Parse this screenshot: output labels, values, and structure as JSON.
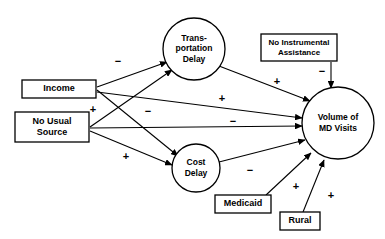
{
  "diagram": {
    "type": "path-diagram",
    "canvas": {
      "width": 385,
      "height": 239
    },
    "colors": {
      "background": "#ffffff",
      "stroke": "#000000",
      "text": "#000000"
    },
    "nodes": [
      {
        "id": "transportation-delay",
        "shape": "circle",
        "label_lines": [
          "Trans-",
          "portation",
          "Delay"
        ],
        "cx": 194,
        "cy": 49,
        "r": 31,
        "font_size": 8.5
      },
      {
        "id": "income",
        "shape": "box",
        "label_lines": [
          "Income"
        ],
        "x": 22,
        "y": 80,
        "w": 74,
        "h": 18,
        "font_size": 9
      },
      {
        "id": "no-usual-source",
        "shape": "box",
        "label_lines": [
          "No Usual",
          "Source"
        ],
        "x": 15,
        "y": 112,
        "w": 74,
        "h": 30,
        "font_size": 9
      },
      {
        "id": "no-instrumental-assistance",
        "shape": "box",
        "label_lines": [
          "No Instrumental",
          "Assistance"
        ],
        "x": 261,
        "y": 34,
        "w": 76,
        "h": 27,
        "font_size": 8
      },
      {
        "id": "volume-of-md-visits",
        "shape": "circle",
        "label_lines": [
          "Volume of",
          "MD Visits"
        ],
        "cx": 338,
        "cy": 123,
        "r": 36,
        "font_size": 8.5
      },
      {
        "id": "cost-delay",
        "shape": "circle",
        "label_lines": [
          "Cost",
          "Delay"
        ],
        "cx": 196,
        "cy": 168,
        "r": 24,
        "font_size": 8.5
      },
      {
        "id": "medicaid",
        "shape": "box",
        "label_lines": [
          "Medicaid"
        ],
        "x": 215,
        "y": 195,
        "w": 56,
        "h": 18,
        "font_size": 9
      },
      {
        "id": "rural",
        "shape": "box",
        "label_lines": [
          "Rural"
        ],
        "x": 280,
        "y": 212,
        "w": 40,
        "h": 18,
        "font_size": 9
      }
    ],
    "edges": [
      {
        "id": "income-to-transportation-delay",
        "from": "income",
        "to": "transportation-delay",
        "sign": "−",
        "x1": 97,
        "y1": 87,
        "x2": 167,
        "y2": 62,
        "sign_x": 118,
        "sign_y": 62
      },
      {
        "id": "income-to-cost-delay",
        "from": "income",
        "to": "cost-delay",
        "sign": "−",
        "x1": 97,
        "y1": 90,
        "x2": 178,
        "y2": 156,
        "sign_x": 148,
        "sign_y": 112
      },
      {
        "id": "income-to-volume",
        "from": "income",
        "to": "volume-of-md-visits",
        "sign": "+",
        "x1": 97,
        "y1": 92,
        "x2": 302,
        "y2": 118,
        "sign_x": 222,
        "sign_y": 99
      },
      {
        "id": "no-usual-source-to-transportation-delay",
        "from": "no-usual-source",
        "to": "transportation-delay",
        "sign": "+",
        "x1": 90,
        "y1": 127,
        "x2": 172,
        "y2": 70,
        "sign_x": 93,
        "sign_y": 110
      },
      {
        "id": "no-usual-source-to-volume",
        "from": "no-usual-source",
        "to": "volume-of-md-visits",
        "sign": "−",
        "x1": 90,
        "y1": 128,
        "x2": 302,
        "y2": 126,
        "sign_x": 233,
        "sign_y": 122
      },
      {
        "id": "no-usual-source-to-cost-delay",
        "from": "no-usual-source",
        "to": "cost-delay",
        "sign": "+",
        "x1": 90,
        "y1": 131,
        "x2": 172,
        "y2": 165,
        "sign_x": 126,
        "sign_y": 157
      },
      {
        "id": "transportation-delay-to-volume",
        "from": "transportation-delay",
        "to": "volume-of-md-visits",
        "sign": "+",
        "x1": 219,
        "y1": 66,
        "x2": 310,
        "y2": 101,
        "sign_x": 277,
        "sign_y": 82
      },
      {
        "id": "no-instrumental-assistance-to-volume",
        "from": "no-instrumental-assistance",
        "to": "volume-of-md-visits",
        "sign": "−",
        "x1": 331,
        "y1": 62,
        "x2": 331,
        "y2": 88,
        "sign_x": 322,
        "sign_y": 72
      },
      {
        "id": "cost-delay-to-volume",
        "from": "cost-delay",
        "to": "volume-of-md-visits",
        "sign": "−",
        "x1": 219,
        "y1": 162,
        "x2": 305,
        "y2": 140,
        "sign_x": 250,
        "sign_y": 171
      },
      {
        "id": "medicaid-to-volume",
        "from": "medicaid",
        "to": "volume-of-md-visits",
        "sign": "+",
        "x1": 266,
        "y1": 195,
        "x2": 311,
        "y2": 153,
        "sign_x": 296,
        "sign_y": 187
      },
      {
        "id": "rural-to-volume",
        "from": "rural",
        "to": "volume-of-md-visits",
        "sign": "+",
        "x1": 303,
        "y1": 212,
        "x2": 324,
        "y2": 160,
        "sign_x": 331,
        "sign_y": 196
      }
    ]
  }
}
